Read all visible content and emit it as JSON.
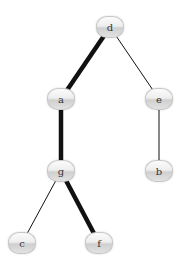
{
  "diagram": {
    "type": "tree",
    "colors": {
      "edge": "#111111",
      "node_fill_top": "#fbfbfb",
      "node_fill_bottom": "#cfcfcf",
      "node_border": "#c8c8c8",
      "label": "#333333"
    },
    "nodes": [
      {
        "id": "d",
        "label": "d",
        "x": 110,
        "y": 27
      },
      {
        "id": "a",
        "label": "a",
        "x": 61,
        "y": 99
      },
      {
        "id": "e",
        "label": "e",
        "x": 159,
        "y": 99
      },
      {
        "id": "g",
        "label": "g",
        "x": 61,
        "y": 171
      },
      {
        "id": "b",
        "label": "b",
        "x": 159,
        "y": 171
      },
      {
        "id": "c",
        "label": "c",
        "x": 22,
        "y": 243
      },
      {
        "id": "f",
        "label": "f",
        "x": 99,
        "y": 243
      }
    ],
    "edges": [
      {
        "from": "d",
        "to": "a",
        "highlighted": true
      },
      {
        "from": "d",
        "to": "e",
        "highlighted": false
      },
      {
        "from": "a",
        "to": "g",
        "highlighted": true
      },
      {
        "from": "e",
        "to": "b",
        "highlighted": false
      },
      {
        "from": "g",
        "to": "c",
        "highlighted": false
      },
      {
        "from": "g",
        "to": "f",
        "highlighted": true
      }
    ],
    "highlighted_path": [
      "d",
      "a",
      "g",
      "f"
    ]
  }
}
